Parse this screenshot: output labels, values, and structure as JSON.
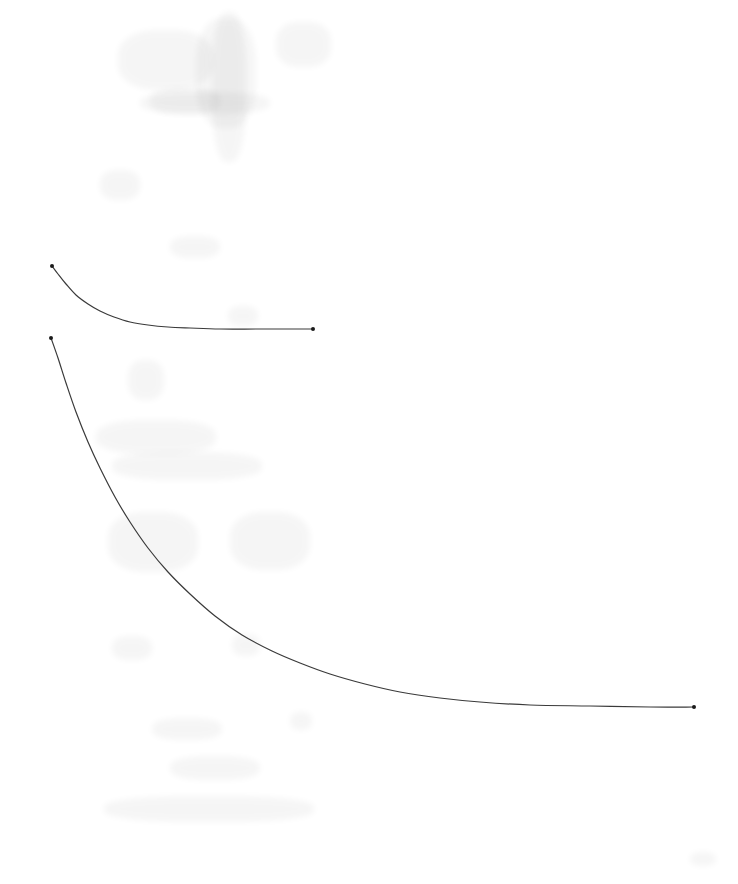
{
  "document": {
    "kind": "scanned-figure",
    "background_color": "#ffffff",
    "width_px": 738,
    "height_px": 884,
    "visible_text": "",
    "notes_visible": "none"
  },
  "figure": {
    "name": "two-decay-curves",
    "title": "",
    "subtitle": "",
    "axes_visible": false,
    "gridlines_visible": false,
    "legend_visible": false,
    "tick_labels_visible": false,
    "axis_labels_visible": false,
    "annotations": [],
    "line_color": "#3a3a3a",
    "marker_color": "#1a1a1a",
    "line_width_px": 1.2,
    "marker_size_px": 4
  },
  "chart_data": {
    "type": "line",
    "title": "",
    "xlabel": "",
    "ylabel": "",
    "xlim": [
      0,
      738
    ],
    "ylim": [
      884,
      0
    ],
    "grid": false,
    "legend": false,
    "legend_position": "none",
    "axis_visible": false,
    "tick_labels": [],
    "coordinate_space": "pixel",
    "series": [
      {
        "name": "upper-curve",
        "marker": "dot-at-endpoints",
        "points": [
          {
            "x": 52,
            "y": 266
          },
          {
            "x": 58,
            "y": 274
          },
          {
            "x": 66,
            "y": 284
          },
          {
            "x": 76,
            "y": 295
          },
          {
            "x": 88,
            "y": 304
          },
          {
            "x": 100,
            "y": 311
          },
          {
            "x": 114,
            "y": 317
          },
          {
            "x": 130,
            "y": 322
          },
          {
            "x": 148,
            "y": 325
          },
          {
            "x": 168,
            "y": 327
          },
          {
            "x": 190,
            "y": 328
          },
          {
            "x": 220,
            "y": 329
          },
          {
            "x": 260,
            "y": 329
          },
          {
            "x": 313,
            "y": 329
          }
        ],
        "endpoints": [
          {
            "x": 52,
            "y": 266
          },
          {
            "x": 313,
            "y": 329
          }
        ],
        "asymptote_y": 329,
        "x_start": 52,
        "x_end": 313
      },
      {
        "name": "lower-curve",
        "marker": "dot-at-endpoints",
        "points": [
          {
            "x": 51,
            "y": 338
          },
          {
            "x": 58,
            "y": 358
          },
          {
            "x": 66,
            "y": 383
          },
          {
            "x": 76,
            "y": 412
          },
          {
            "x": 88,
            "y": 442
          },
          {
            "x": 100,
            "y": 468
          },
          {
            "x": 115,
            "y": 497
          },
          {
            "x": 130,
            "y": 522
          },
          {
            "x": 148,
            "y": 548
          },
          {
            "x": 168,
            "y": 572
          },
          {
            "x": 190,
            "y": 594
          },
          {
            "x": 215,
            "y": 616
          },
          {
            "x": 242,
            "y": 635
          },
          {
            "x": 272,
            "y": 651
          },
          {
            "x": 300,
            "y": 663
          },
          {
            "x": 330,
            "y": 674
          },
          {
            "x": 365,
            "y": 684
          },
          {
            "x": 400,
            "y": 692
          },
          {
            "x": 440,
            "y": 698
          },
          {
            "x": 480,
            "y": 702
          },
          {
            "x": 530,
            "y": 705
          },
          {
            "x": 590,
            "y": 706
          },
          {
            "x": 650,
            "y": 707
          },
          {
            "x": 694,
            "y": 707
          }
        ],
        "endpoints": [
          {
            "x": 51,
            "y": 338
          },
          {
            "x": 694,
            "y": 707
          }
        ],
        "asymptote_y": 707,
        "x_start": 51,
        "x_end": 694
      }
    ]
  },
  "artifacts": {
    "description": "faint scanner bleed-through smudges, no legible text",
    "opacity": 0.035,
    "spots": [
      {
        "x": 118,
        "y": 30,
        "w": 95,
        "h": 60
      },
      {
        "x": 150,
        "y": 88,
        "w": 70,
        "h": 26
      },
      {
        "x": 196,
        "y": 18,
        "w": 60,
        "h": 110
      },
      {
        "x": 212,
        "y": 12,
        "w": 34,
        "h": 150
      },
      {
        "x": 276,
        "y": 22,
        "w": 55,
        "h": 45
      },
      {
        "x": 140,
        "y": 92,
        "w": 130,
        "h": 22
      },
      {
        "x": 100,
        "y": 170,
        "w": 40,
        "h": 30
      },
      {
        "x": 128,
        "y": 360,
        "w": 36,
        "h": 40
      },
      {
        "x": 96,
        "y": 420,
        "w": 120,
        "h": 34
      },
      {
        "x": 112,
        "y": 452,
        "w": 150,
        "h": 28
      },
      {
        "x": 108,
        "y": 512,
        "w": 90,
        "h": 60
      },
      {
        "x": 230,
        "y": 512,
        "w": 80,
        "h": 58
      },
      {
        "x": 112,
        "y": 636,
        "w": 40,
        "h": 24
      },
      {
        "x": 232,
        "y": 634,
        "w": 28,
        "h": 22
      },
      {
        "x": 152,
        "y": 718,
        "w": 70,
        "h": 22
      },
      {
        "x": 170,
        "y": 756,
        "w": 90,
        "h": 24
      },
      {
        "x": 104,
        "y": 796,
        "w": 210,
        "h": 26
      },
      {
        "x": 290,
        "y": 712,
        "w": 22,
        "h": 18
      },
      {
        "x": 170,
        "y": 236,
        "w": 50,
        "h": 22
      },
      {
        "x": 228,
        "y": 306,
        "w": 30,
        "h": 20
      },
      {
        "x": 690,
        "y": 852,
        "w": 26,
        "h": 14
      }
    ]
  }
}
